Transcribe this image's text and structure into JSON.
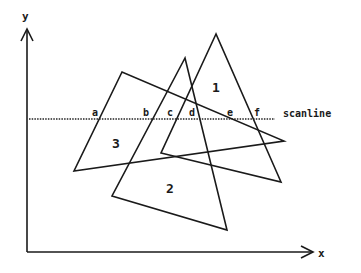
{
  "diagram": {
    "axes": {
      "y_label": "y",
      "x_label": "x",
      "origin": [
        27,
        252
      ],
      "y_top": [
        27,
        30
      ],
      "x_right": [
        310,
        252
      ]
    },
    "scanline": {
      "label": "scanline",
      "y": 119,
      "x_start": 29,
      "x_end": 275,
      "intersections": [
        {
          "label": "a",
          "x": 95
        },
        {
          "label": "b",
          "x": 147
        },
        {
          "label": "c",
          "x": 171
        },
        {
          "label": "d",
          "x": 193
        },
        {
          "label": "e",
          "x": 230
        },
        {
          "label": "f",
          "x": 256
        }
      ]
    },
    "triangles": [
      {
        "id": "1",
        "label": "1",
        "points": "216,34 161,153 281,182",
        "label_pos": [
          216,
          90
        ]
      },
      {
        "id": "2",
        "label": "2",
        "points": "185,58 112,196 227,230",
        "label_pos": [
          170,
          190
        ]
      },
      {
        "id": "3",
        "label": "3",
        "points": "122,72 74,171 284,141",
        "label_pos": [
          117,
          146
        ]
      }
    ]
  }
}
